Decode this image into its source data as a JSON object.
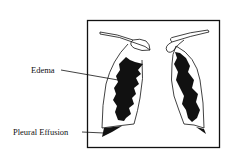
{
  "diagram": {
    "labels": {
      "edema": "Edema",
      "pleural_effusion": "Pleural Effusion"
    },
    "colors": {
      "ink": "#111111",
      "background": "#ffffff"
    }
  }
}
